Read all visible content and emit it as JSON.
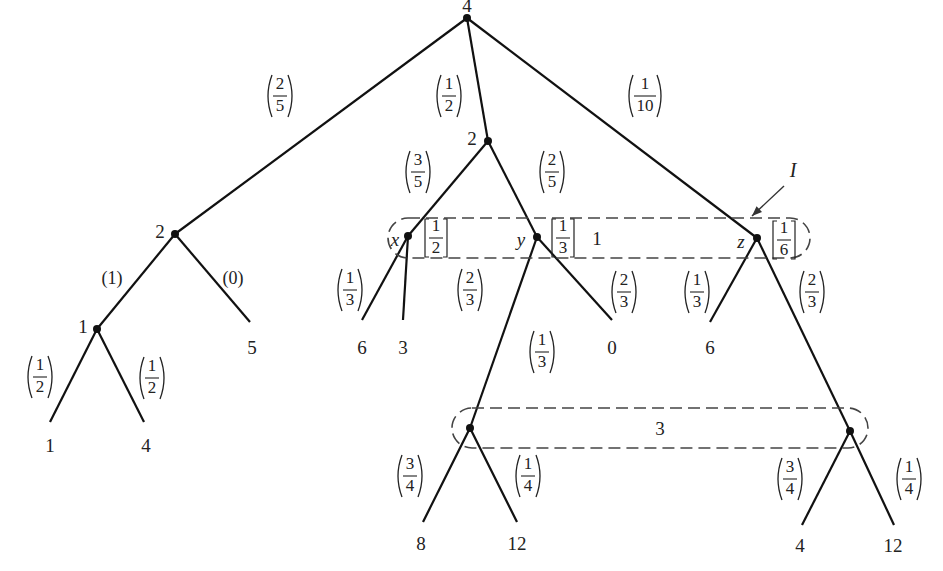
{
  "diagram": {
    "type": "game-tree",
    "info_set_I_label": "I",
    "nodes": [
      {
        "id": "root",
        "x": 467,
        "y": 18,
        "value": "4",
        "lx": 467,
        "ly": 8
      },
      {
        "id": "a",
        "x": 175,
        "y": 234,
        "value": "2",
        "lx": 160,
        "ly": 234
      },
      {
        "id": "b",
        "x": 488,
        "y": 141,
        "value": "2",
        "lx": 472,
        "ly": 141
      },
      {
        "id": "x",
        "x": 408,
        "y": 236,
        "value": "",
        "name": "x"
      },
      {
        "id": "y",
        "x": 537,
        "y": 237,
        "value": "",
        "name": "y"
      },
      {
        "id": "z",
        "x": 757,
        "y": 238,
        "value": "",
        "name": "z"
      },
      {
        "id": "c",
        "x": 97,
        "y": 329,
        "value": "1",
        "lx": 83,
        "ly": 329
      },
      {
        "id": "p",
        "x": 470,
        "y": 428,
        "value": ""
      },
      {
        "id": "q",
        "x": 850,
        "y": 431,
        "value": ""
      }
    ],
    "leaves": [
      {
        "x": 50,
        "y": 422,
        "value": "1",
        "lx": 50,
        "ly": 448
      },
      {
        "x": 144,
        "y": 422,
        "value": "4",
        "lx": 146,
        "ly": 448
      },
      {
        "x": 250,
        "y": 322,
        "value": "5",
        "lx": 252,
        "ly": 350
      },
      {
        "x": 362,
        "y": 320,
        "value": "6",
        "lx": 362,
        "ly": 350
      },
      {
        "x": 403,
        "y": 320,
        "value": "3",
        "lx": 403,
        "ly": 350
      },
      {
        "x": 612,
        "y": 320,
        "value": "0",
        "lx": 612,
        "ly": 350
      },
      {
        "x": 710,
        "y": 322,
        "value": "6",
        "lx": 710,
        "ly": 350
      },
      {
        "x": 423,
        "y": 522,
        "value": "8",
        "lx": 421,
        "ly": 546
      },
      {
        "x": 517,
        "y": 522,
        "value": "12",
        "lx": 517,
        "ly": 546
      },
      {
        "x": 802,
        "y": 525,
        "value": "4",
        "lx": 800,
        "ly": 548
      },
      {
        "x": 894,
        "y": 525,
        "value": "12",
        "lx": 893,
        "ly": 548
      }
    ],
    "edges": [
      {
        "from": [
          467,
          18
        ],
        "to": [
          175,
          234
        ],
        "prob": {
          "num": "2",
          "den": "5"
        },
        "lx": 280,
        "ly": 96
      },
      {
        "from": [
          467,
          18
        ],
        "to": [
          488,
          141
        ],
        "prob": {
          "num": "1",
          "den": "2"
        },
        "lx": 449,
        "ly": 96
      },
      {
        "from": [
          467,
          18
        ],
        "to": [
          757,
          238
        ],
        "prob": {
          "num": "1",
          "den": "10"
        },
        "lx": 645,
        "ly": 96
      },
      {
        "from": [
          175,
          234
        ],
        "to": [
          97,
          329
        ],
        "prob_text": "(1)",
        "lx": 112,
        "ly": 280
      },
      {
        "from": [
          175,
          234
        ],
        "to": [
          250,
          322
        ],
        "prob_text": "(0)",
        "lx": 233,
        "ly": 280
      },
      {
        "from": [
          97,
          329
        ],
        "to": [
          50,
          422
        ],
        "prob": {
          "num": "1",
          "den": "2"
        },
        "lx": 40,
        "ly": 377
      },
      {
        "from": [
          97,
          329
        ],
        "to": [
          144,
          422
        ],
        "prob": {
          "num": "1",
          "den": "2"
        },
        "lx": 152,
        "ly": 378
      },
      {
        "from": [
          488,
          141
        ],
        "to": [
          408,
          236
        ],
        "prob": {
          "num": "3",
          "den": "5"
        },
        "lx": 418,
        "ly": 172
      },
      {
        "from": [
          488,
          141
        ],
        "to": [
          537,
          237
        ],
        "prob": {
          "num": "2",
          "den": "5"
        },
        "lx": 552,
        "ly": 172
      },
      {
        "from": [
          408,
          236
        ],
        "to": [
          362,
          320
        ],
        "prob": {
          "num": "1",
          "den": "3"
        },
        "lx": 350,
        "ly": 290
      },
      {
        "from": [
          408,
          236
        ],
        "to": [
          403,
          320
        ],
        "prob": {
          "num": "2",
          "den": "3"
        },
        "lx": 470,
        "ly": 290
      },
      {
        "from": [
          537,
          237
        ],
        "to": [
          470,
          428
        ],
        "prob": {
          "num": "1",
          "den": "3"
        },
        "lx": 542,
        "ly": 352
      },
      {
        "from": [
          537,
          237
        ],
        "to": [
          612,
          320
        ],
        "prob": {
          "num": "2",
          "den": "3"
        },
        "lx": 624,
        "ly": 292
      },
      {
        "from": [
          757,
          238
        ],
        "to": [
          710,
          322
        ],
        "prob": {
          "num": "1",
          "den": "3"
        },
        "lx": 697,
        "ly": 292
      },
      {
        "from": [
          757,
          238
        ],
        "to": [
          850,
          431
        ],
        "prob": {
          "num": "2",
          "den": "3"
        },
        "lx": 812,
        "ly": 292
      },
      {
        "from": [
          470,
          428
        ],
        "to": [
          423,
          522
        ],
        "prob": {
          "num": "3",
          "den": "4"
        },
        "lx": 410,
        "ly": 476
      },
      {
        "from": [
          470,
          428
        ],
        "to": [
          517,
          522
        ],
        "prob": {
          "num": "1",
          "den": "4"
        },
        "lx": 528,
        "ly": 476
      },
      {
        "from": [
          850,
          431
        ],
        "to": [
          802,
          525
        ],
        "prob": {
          "num": "3",
          "den": "4"
        },
        "lx": 790,
        "ly": 479
      },
      {
        "from": [
          850,
          431
        ],
        "to": [
          894,
          525
        ],
        "prob": {
          "num": "1",
          "den": "4"
        },
        "lx": 909,
        "ly": 479
      }
    ],
    "info_sets": [
      {
        "id": "I",
        "value": "1",
        "x": 388,
        "y": 218,
        "w": 422,
        "h": 40,
        "lx": 597,
        "ly": 241
      },
      {
        "id": "lower",
        "value": "3",
        "x": 452,
        "y": 408,
        "w": 416,
        "h": 40,
        "lx": 660,
        "ly": 431
      }
    ],
    "beliefs": [
      {
        "node": "x",
        "num": "1",
        "den": "2",
        "lx": 436,
        "ly": 238
      },
      {
        "node": "y",
        "num": "1",
        "den": "3",
        "lx": 563,
        "ly": 238
      },
      {
        "node": "z",
        "num": "1",
        "den": "6",
        "lx": 784,
        "ly": 240
      }
    ],
    "node_names": [
      {
        "text": "x",
        "lx": 395,
        "ly": 242
      },
      {
        "text": "y",
        "lx": 521,
        "ly": 242
      },
      {
        "text": "z",
        "lx": 741,
        "ly": 244
      }
    ],
    "arrow": {
      "label": "I",
      "lx": 793,
      "ly": 172,
      "from": [
        784,
        186
      ],
      "to": [
        752,
        216
      ]
    }
  }
}
